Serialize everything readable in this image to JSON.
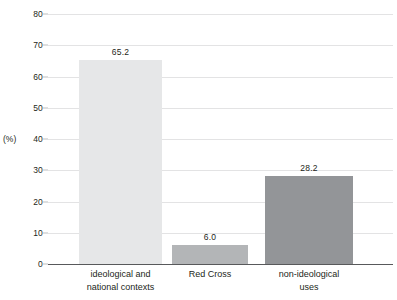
{
  "chart_data": {
    "type": "bar",
    "title": "",
    "subtitle": "",
    "xlabel": "",
    "ylabel": "(%)",
    "ylim": [
      0,
      80
    ],
    "ytick_values": [
      0,
      10,
      20,
      30,
      40,
      50,
      60,
      70,
      80
    ],
    "ytick_labels": [
      "0",
      "10",
      "20",
      "30",
      "40",
      "50",
      "60",
      "70",
      "80"
    ],
    "grid": true,
    "legend": "none",
    "categories": [
      "ideological and\nnational contexts",
      "Red Cross",
      "non-ideological\nuses"
    ],
    "values": [
      65.2,
      6.0,
      28.2
    ],
    "value_labels": [
      "65.2",
      "6.0",
      "28.2"
    ],
    "bar_colors": [
      "#e6e7e8",
      "#b3b5b7",
      "#939598"
    ]
  },
  "axis": {
    "unit_label": "(%)"
  },
  "colors": {
    "gridline": "#e3e3e4",
    "zero_line": "#58595b",
    "text": "#231f20",
    "background": "#ffffff"
  }
}
